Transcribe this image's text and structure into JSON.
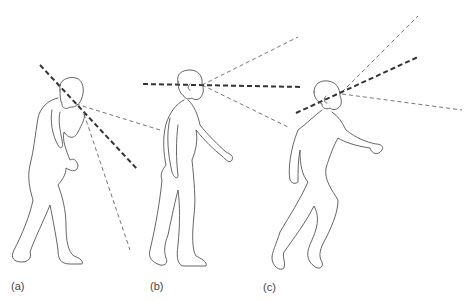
{
  "figure": {
    "panels": [
      {
        "id": "a",
        "label": "(a)",
        "posture": "head bent down looking at phone held in hand"
      },
      {
        "id": "b",
        "label": "(b)",
        "posture": "walking upright, gaze horizontal"
      },
      {
        "id": "c",
        "label": "(c)",
        "posture": "striding, gaze tilted upward"
      }
    ],
    "colors": {
      "background": "#ffffff",
      "outline": "#555555",
      "gaze_axis": "#333333",
      "view_cone": "#666666"
    }
  }
}
